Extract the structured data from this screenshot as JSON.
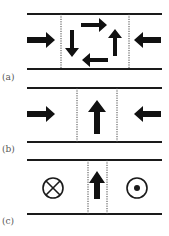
{
  "figure": {
    "panels": [
      {
        "label": "(a)",
        "description": "Opposing horizontal arrows converging on a central region containing a circulating loop of four arrows (clockwise)",
        "left_arrow": "right",
        "right_arrow": "left",
        "center": "circulating-loop"
      },
      {
        "label": "(b)",
        "description": "Opposing horizontal arrows converging on a central region containing a single upward arrow",
        "left_arrow": "right",
        "right_arrow": "left",
        "center": "up-arrow"
      },
      {
        "label": "(c)",
        "description": "Field into page (cross symbol) on left, field out of page (dot symbol) on right, narrow central region with a single upward arrow",
        "left_symbol": "into-page",
        "right_symbol": "out-of-page",
        "center": "up-arrow"
      }
    ],
    "colors": {
      "line": "#1a1a1a",
      "arrow": "#111111",
      "label": "#555555",
      "background": "#ffffff"
    }
  }
}
